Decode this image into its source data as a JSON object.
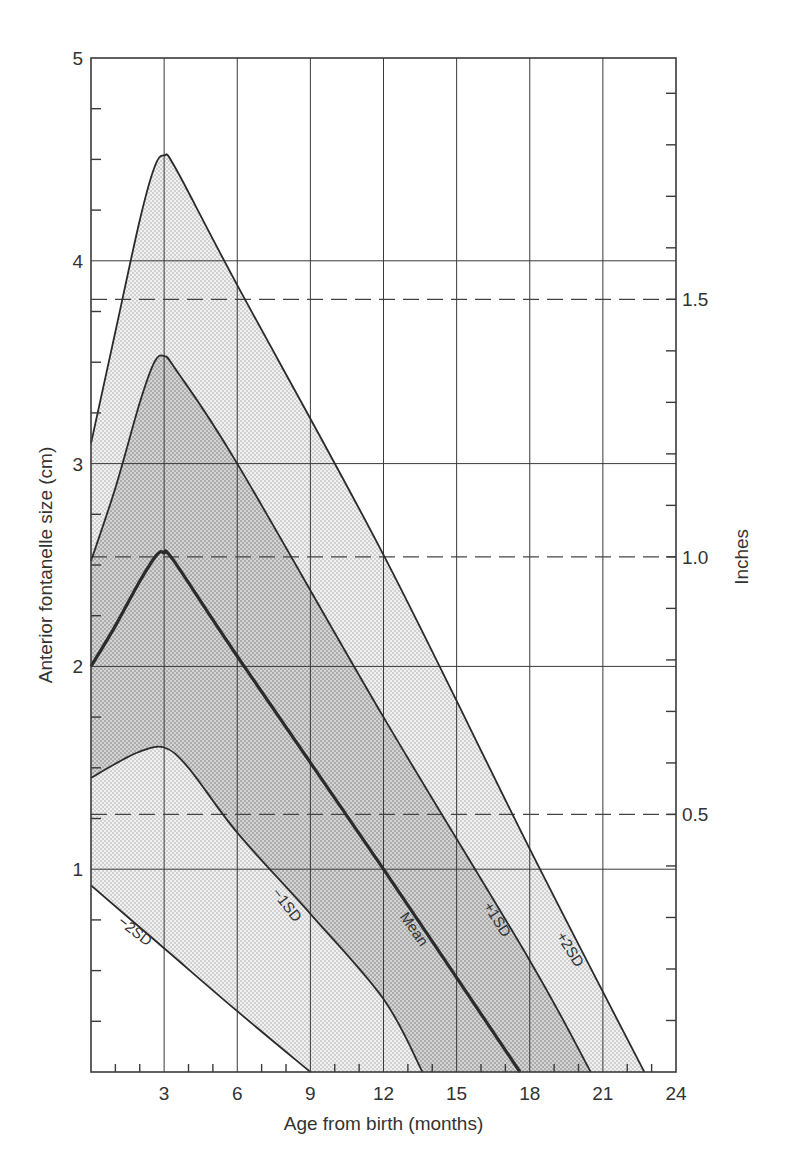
{
  "chart_data": {
    "type": "area",
    "title": "",
    "xlabel": "Age from birth (months)",
    "ylabel": "Anterior fontanelle size (cm)",
    "y2label": "Inches",
    "xlim": [
      0,
      24
    ],
    "ylim": [
      0,
      5
    ],
    "x_ticks": [
      3,
      6,
      9,
      12,
      15,
      18,
      21,
      24
    ],
    "x_minor_step": 1,
    "y_ticks": [
      1,
      2,
      3,
      4,
      5
    ],
    "y_minor_step": 0.25,
    "y2_ticks": [
      {
        "label": "0.5",
        "cm": 1.27
      },
      {
        "label": "1.0",
        "cm": 2.54
      },
      {
        "label": "1.5",
        "cm": 3.81
      }
    ],
    "y2_minor_step_in": 0.1,
    "grid": true,
    "series": [
      {
        "name": "+2SD",
        "label": "+2SD",
        "points": [
          [
            0,
            3.1
          ],
          [
            1,
            3.65
          ],
          [
            2,
            4.2
          ],
          [
            2.6,
            4.46
          ],
          [
            3,
            4.52
          ],
          [
            3.5,
            4.45
          ],
          [
            6,
            3.88
          ],
          [
            12,
            2.55
          ],
          [
            18,
            1.1
          ],
          [
            22.7,
            0
          ]
        ]
      },
      {
        "name": "+1SD",
        "label": "+1SD",
        "points": [
          [
            0,
            2.52
          ],
          [
            1,
            2.88
          ],
          [
            2,
            3.3
          ],
          [
            2.6,
            3.5
          ],
          [
            3,
            3.53
          ],
          [
            3.5,
            3.46
          ],
          [
            6,
            3.0
          ],
          [
            12,
            1.75
          ],
          [
            18,
            0.55
          ],
          [
            20.5,
            0
          ]
        ]
      },
      {
        "name": "Mean",
        "label": "Mean",
        "points": [
          [
            0,
            2.0
          ],
          [
            1,
            2.2
          ],
          [
            2,
            2.42
          ],
          [
            2.7,
            2.55
          ],
          [
            3,
            2.56
          ],
          [
            3.4,
            2.52
          ],
          [
            6,
            2.05
          ],
          [
            12,
            1.0
          ],
          [
            17.6,
            0
          ]
        ]
      },
      {
        "name": "-1SD",
        "label": "−1SD",
        "points": [
          [
            0,
            1.45
          ],
          [
            1,
            1.52
          ],
          [
            2,
            1.58
          ],
          [
            3,
            1.6
          ],
          [
            4,
            1.5
          ],
          [
            6,
            1.18
          ],
          [
            9,
            0.78
          ],
          [
            12,
            0.36
          ],
          [
            13.6,
            0
          ]
        ]
      },
      {
        "name": "-2SD",
        "label": "−2SD",
        "points": [
          [
            0,
            0.92
          ],
          [
            3,
            0.61
          ],
          [
            6,
            0.3
          ],
          [
            9,
            0
          ]
        ]
      }
    ],
    "bands": [
      {
        "between": [
          "-2SD",
          "+2SD"
        ],
        "shade": "light-stipple"
      },
      {
        "between": [
          "-1SD",
          "+1SD"
        ],
        "shade": "dark-stipple"
      }
    ],
    "reference_lines": {
      "dashed_inch_lines_cm": [
        1.27,
        2.54,
        3.81
      ]
    }
  },
  "colors": {
    "line": "#2b2b2b",
    "grid": "#3a3a3a",
    "band_outer": "#ececec",
    "band_inner": "#d2d2d2",
    "background": "#ffffff"
  }
}
